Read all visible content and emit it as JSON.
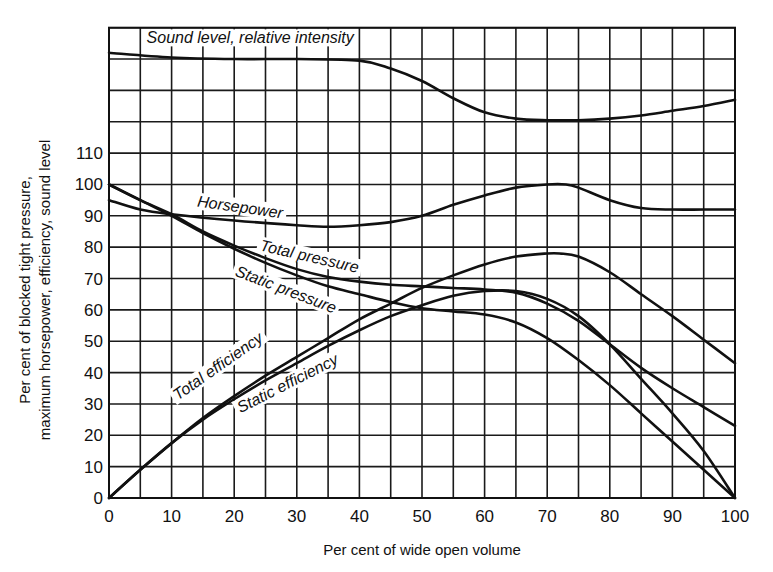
{
  "chart_data": {
    "type": "line",
    "title": "",
    "xlabel": "Per cent of wide open volume",
    "ylabel": [
      "Per cent of blocked tight pressure,",
      "maximum horsepower, efficiency, sound level"
    ],
    "xlim": [
      0,
      100
    ],
    "ylim": [
      0,
      150
    ],
    "x_ticks": [
      0,
      10,
      20,
      30,
      40,
      50,
      60,
      70,
      80,
      90,
      100
    ],
    "y_ticks": [
      0,
      10,
      20,
      30,
      40,
      50,
      60,
      70,
      80,
      90,
      100,
      110
    ],
    "grid": {
      "on": true,
      "x_step": 5,
      "y_step": 10
    },
    "legend": "none (curves labeled inline)",
    "series": [
      {
        "name": "Sound level, relative intensity",
        "x": [
          0,
          10,
          20,
          30,
          40,
          45,
          50,
          55,
          60,
          65,
          70,
          75,
          80,
          85,
          90,
          95,
          100
        ],
        "y": [
          142,
          140.5,
          140,
          140,
          139.5,
          137,
          133,
          127.5,
          123,
          121,
          120.5,
          120.5,
          121,
          122,
          123.5,
          125,
          127
        ]
      },
      {
        "name": "Horsepower",
        "x": [
          0,
          5,
          10,
          20,
          30,
          35,
          40,
          45,
          50,
          55,
          60,
          65,
          70,
          73,
          75,
          80,
          85,
          90,
          95,
          100
        ],
        "y": [
          95,
          92,
          90.5,
          88.5,
          87,
          86.5,
          87,
          88,
          90,
          93.5,
          96.5,
          99,
          100,
          100,
          99,
          95,
          92.5,
          92,
          92,
          92
        ]
      },
      {
        "name": "Total pressure",
        "x": [
          0,
          5,
          10,
          15,
          20,
          25,
          30,
          35,
          40,
          45,
          50,
          55,
          60,
          65,
          70,
          75,
          80,
          85,
          90,
          95,
          100
        ],
        "y": [
          100,
          95,
          90.5,
          85,
          80.5,
          76.5,
          73,
          70.5,
          69,
          68,
          67.5,
          67,
          66.5,
          65.5,
          62,
          56.5,
          49,
          41.5,
          35,
          29,
          23
        ]
      },
      {
        "name": "Static pressure",
        "x": [
          0,
          5,
          10,
          15,
          20,
          25,
          30,
          35,
          40,
          45,
          50,
          55,
          60,
          65,
          70,
          75,
          80,
          85,
          90,
          95,
          100
        ],
        "y": [
          100,
          95,
          90,
          84.5,
          79.5,
          75,
          71,
          67.5,
          65,
          62.5,
          60.5,
          59.5,
          58.5,
          56,
          51,
          44,
          36,
          27,
          18,
          9,
          0
        ]
      },
      {
        "name": "Total efficiency",
        "x": [
          0,
          5,
          10,
          15,
          20,
          25,
          30,
          35,
          40,
          45,
          50,
          55,
          60,
          65,
          70,
          72,
          75,
          80,
          85,
          90,
          95,
          100
        ],
        "y": [
          0,
          9,
          17.5,
          25.5,
          32.5,
          39,
          45,
          51,
          57,
          62,
          67,
          71,
          74.5,
          77,
          78,
          78,
          77,
          72,
          65,
          58,
          50.5,
          43
        ]
      },
      {
        "name": "Static efficiency",
        "x": [
          0,
          5,
          10,
          15,
          20,
          25,
          30,
          35,
          40,
          45,
          50,
          55,
          60,
          65,
          70,
          75,
          80,
          85,
          90,
          95,
          100
        ],
        "y": [
          0,
          9,
          17.5,
          25,
          31.5,
          37.5,
          43,
          48.5,
          53.5,
          58,
          61.5,
          64.5,
          66,
          66,
          63.5,
          58,
          49,
          38,
          27,
          15,
          0
        ]
      }
    ],
    "annotations": [
      {
        "text": "Sound level, relative intensity",
        "x": 6,
        "y": 145,
        "rotate": 0
      },
      {
        "text": "Horsepower",
        "x": 14,
        "y": 93,
        "rotate": 8
      },
      {
        "text": "Total pressure",
        "x": 24,
        "y": 79,
        "rotate": 13
      },
      {
        "text": "Static pressure",
        "x": 20,
        "y": 71,
        "rotate": 21
      },
      {
        "text": "Total efficiency",
        "x": 11,
        "y": 31,
        "rotate": -35
      },
      {
        "text": "Static efficiency",
        "x": 21,
        "y": 27,
        "rotate": -27
      }
    ]
  },
  "layout": {
    "plot_left_px": 109,
    "plot_right_px": 735,
    "plot_bottom_px": 498,
    "plot_top_px": 27.7
  }
}
